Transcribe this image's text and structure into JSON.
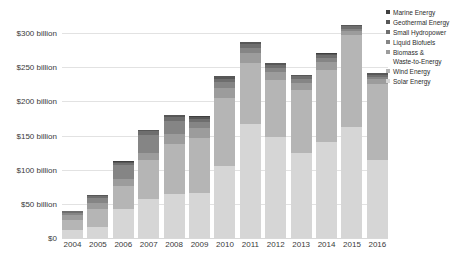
{
  "chart_data": {
    "type": "bar",
    "stacked": true,
    "title": "",
    "xlabel": "",
    "ylabel": "",
    "categories": [
      "2004",
      "2005",
      "2006",
      "2007",
      "2008",
      "2009",
      "2010",
      "2011",
      "2012",
      "2013",
      "2014",
      "2015",
      "2016"
    ],
    "ylim": [
      0,
      325
    ],
    "yticks": [
      0,
      50,
      100,
      150,
      200,
      250,
      300
    ],
    "ytick_labels": [
      "$0",
      "$50 billion",
      "$100 billion",
      "$150 billion",
      "$200 billion",
      "$250 billion",
      "$300 billion"
    ],
    "grid": true,
    "legend_position": "right",
    "units": "billion USD",
    "series": [
      {
        "name": "Marine Energy",
        "color": "#3f3f3f",
        "values": [
          0.2,
          0.3,
          0.4,
          0.5,
          0.6,
          0.4,
          0.4,
          0.3,
          0.3,
          0.3,
          0.4,
          0.3,
          0.2
        ]
      },
      {
        "name": "Geothermal Energy",
        "color": "#575757",
        "values": [
          1.2,
          1.6,
          1.8,
          2.1,
          2.6,
          2.9,
          3.1,
          3.4,
          2.6,
          2.4,
          2.7,
          2.2,
          2.7
        ]
      },
      {
        "name": "Small Hydropower",
        "color": "#6e6e6e",
        "values": [
          2.0,
          2.6,
          3.6,
          4.6,
          5.6,
          4.8,
          4.9,
          5.3,
          4.2,
          4.0,
          4.5,
          3.5,
          3.4
        ]
      },
      {
        "name": "Liquid Biofuels",
        "color": "#858585",
        "values": [
          3.5,
          8.4,
          20.6,
          26.4,
          18.9,
          9.4,
          9.2,
          7.7,
          5.3,
          5.0,
          5.1,
          3.1,
          2.2
        ]
      },
      {
        "name": "Biomass & Waste-to-Energy",
        "color": "#9c9c9c",
        "values": [
          6.3,
          8.0,
          9.3,
          11.0,
          14.3,
          13.4,
          14.8,
          14.6,
          12.3,
          11.7,
          12.2,
          7.0,
          6.8
        ]
      },
      {
        "name": "Wind Energy",
        "color": "#b5b5b5",
        "values": [
          15.1,
          26.8,
          34.7,
          57.0,
          74.1,
          81.1,
          99.6,
          89.0,
          83.2,
          92.0,
          105.6,
          133.5,
          112.5
        ]
      },
      {
        "name": "Solar Energy",
        "color": "#d6d6d6",
        "values": [
          12.0,
          16.0,
          42.0,
          57.0,
          64.0,
          66.0,
          105.0,
          167.0,
          148.0,
          124.0,
          140.0,
          163.0,
          113.7
        ]
      }
    ],
    "totals": [
      40.3,
      63.7,
      112.4,
      158.6,
      180.1,
      178.0,
      237.0,
      287.3,
      255.9,
      239.4,
      270.5,
      312.6,
      241.5
    ],
    "annotations": []
  },
  "legend": {
    "items": [
      {
        "label": "Marine Energy"
      },
      {
        "label": "Geothermal Energy"
      },
      {
        "label": "Small Hydropower"
      },
      {
        "label": "Liquid Biofuels"
      },
      {
        "label": "Biomass &\nWaste-to-Energy"
      },
      {
        "label": "Wind Energy"
      },
      {
        "label": "Solar Energy"
      }
    ]
  }
}
